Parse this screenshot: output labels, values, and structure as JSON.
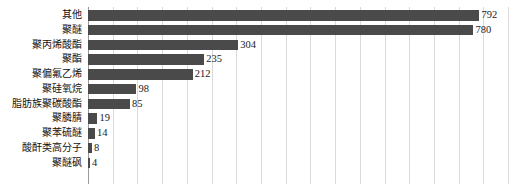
{
  "chart_data": {
    "type": "bar",
    "orientation": "horizontal",
    "title": "",
    "subtitle": "",
    "xlabel": "",
    "ylabel": "",
    "categories": [
      "其他",
      "聚醚",
      "聚丙烯酸酯",
      "聚酯",
      "聚偏氟乙烯",
      "聚硅氧烷",
      "脂肪族聚碳酸酯",
      "聚膦腈",
      "聚苯硫醚",
      "酸酐类高分子",
      "聚醚砜"
    ],
    "values": [
      792,
      780,
      304,
      235,
      212,
      98,
      85,
      19,
      14,
      8,
      4
    ],
    "data_labels": [
      "792",
      "780",
      "304",
      "235",
      "212",
      "98",
      "85",
      "19",
      "14",
      "8",
      "4"
    ],
    "xlim": [
      0,
      860
    ],
    "gridline_step": 50,
    "grid": true,
    "grid_axis": "x",
    "tick_labels_visible": false,
    "legend": null,
    "legend_position": "none",
    "bar_color": "#4a4a4a",
    "grid_color": "#d9d9d9",
    "axis_color": "#9a9a9a",
    "background_color": "#ffffff",
    "label_color": "#111111"
  }
}
